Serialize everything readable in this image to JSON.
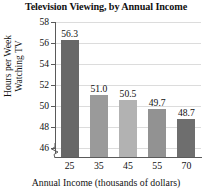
{
  "chart_data": {
    "type": "bar",
    "title": "Television Viewing, by Annual Income",
    "xlabel": "Annual Income (thousands of dollars)",
    "ylabel_line1": "Hours per Week",
    "ylabel_line2": "Watching TV",
    "categories": [
      "25",
      "35",
      "45",
      "55",
      "70"
    ],
    "values": [
      56.3,
      51.0,
      50.5,
      49.7,
      48.7
    ],
    "value_labels": [
      "56.3",
      "51.0",
      "50.5",
      "49.7",
      "48.7"
    ],
    "bar_colors": [
      "#686868",
      "#9a9a9a",
      "#b2b2b2",
      "#929292",
      "#6e6e6e"
    ],
    "ylim": [
      45.0,
      58.0
    ],
    "yticks": [
      58,
      56,
      54,
      52,
      50,
      48,
      46
    ],
    "ytick_labels": [
      "58",
      "56",
      "54",
      "52",
      "50",
      "48",
      "46"
    ],
    "grid": true,
    "grid_color": "#dcdcdc",
    "axis_color": "#5a5a5a",
    "axis_break": true,
    "legend": "none"
  }
}
